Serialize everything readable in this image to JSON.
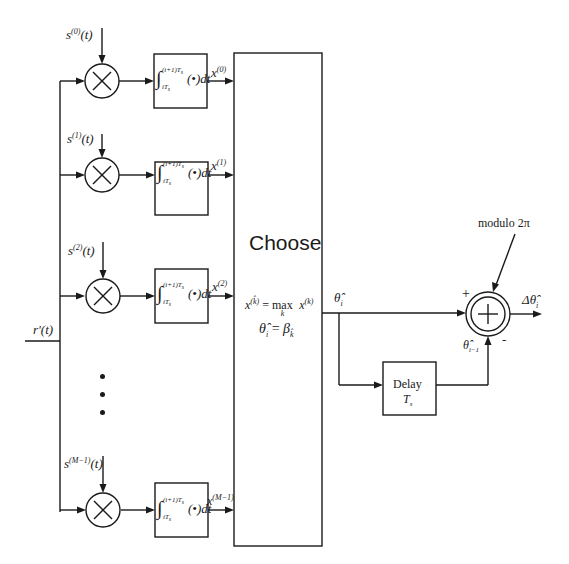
{
  "diagram": {
    "input": {
      "label": "r'(t)"
    },
    "branches": [
      {
        "ref_signal": "s",
        "ref_index": "(0)",
        "ref_arg": "(t)",
        "output": "x",
        "output_index": "(0)"
      },
      {
        "ref_signal": "s",
        "ref_index": "(1)",
        "ref_arg": "(t)",
        "output": "x",
        "output_index": "(1)"
      },
      {
        "ref_signal": "s",
        "ref_index": "(2)",
        "ref_arg": "(t)",
        "output": "x",
        "output_index": "(2)"
      },
      {
        "ref_signal": "s",
        "ref_index": "(M−1)",
        "ref_arg": "(t)",
        "output": "x",
        "output_index": "(M−1)"
      }
    ],
    "integrator": {
      "symbol": "∫",
      "upper_limit": "(i+1)T",
      "upper_sub": "s",
      "lower_limit": "iT",
      "lower_sub": "s",
      "body": "(•)dt"
    },
    "multiplier_symbol": "×",
    "ellipsis": "⋮",
    "choose_block": {
      "title": "Choose",
      "equation1": "x^(k̂) = max_k x^(k)",
      "eq1_lhs": "x",
      "eq1_lhs_sup": "(k̂)",
      "eq1_op": "= max",
      "eq1_sub": "k",
      "eq1_rhs": "x",
      "eq1_rhs_sup": "(k)",
      "equation2": "θ̂_i = β_k̂",
      "eq2_lhs": "θ̂",
      "eq2_lhs_sub": "i",
      "eq2_op": "=",
      "eq2_rhs": "β",
      "eq2_rhs_sub": "k̂"
    },
    "choose_output": {
      "symbol": "θ̂",
      "sub": "i"
    },
    "delay_block": {
      "label": "Delay",
      "param": "T",
      "param_sub": "s"
    },
    "delayed_signal": {
      "symbol": "θ̂",
      "sub": "i−1"
    },
    "summer": {
      "plus_sign": "+",
      "minus_sign": "-",
      "modulo_label": "modulo 2π"
    },
    "final_output": {
      "prefix": "Δ",
      "symbol": "θ̂",
      "sub": "i"
    }
  }
}
